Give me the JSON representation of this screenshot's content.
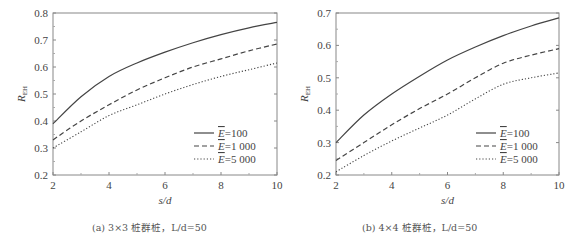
{
  "chart_data": [
    {
      "type": "line",
      "panel": "a",
      "caption": "(a) 3×3 桩群桩，L/d=50",
      "xlabel": "s/d",
      "ylabel": "R_EH",
      "xlim": [
        2,
        10
      ],
      "ylim": [
        0.2,
        0.8
      ],
      "xticks": [
        2,
        4,
        6,
        8,
        10
      ],
      "yticks": [
        0.2,
        0.3,
        0.4,
        0.5,
        0.6,
        0.7,
        0.8
      ],
      "grid": false,
      "legend_position": "lower right",
      "x": [
        2,
        3,
        4,
        5,
        6,
        7,
        8,
        9,
        10
      ],
      "series": [
        {
          "name": "Ē=100",
          "style": "solid",
          "values": [
            0.39,
            0.49,
            0.565,
            0.615,
            0.655,
            0.69,
            0.72,
            0.745,
            0.765
          ]
        },
        {
          "name": "Ē=1 000",
          "style": "dashed",
          "values": [
            0.33,
            0.4,
            0.46,
            0.515,
            0.56,
            0.6,
            0.63,
            0.66,
            0.685
          ]
        },
        {
          "name": "Ē=5 000",
          "style": "dotted",
          "values": [
            0.3,
            0.36,
            0.42,
            0.46,
            0.5,
            0.535,
            0.565,
            0.59,
            0.615
          ]
        }
      ]
    },
    {
      "type": "line",
      "panel": "b",
      "caption": "(b) 4×4 桩群桩，L/d=50",
      "xlabel": "s/d",
      "ylabel": "R_EH",
      "xlim": [
        2,
        10
      ],
      "ylim": [
        0.2,
        0.7
      ],
      "xticks": [
        2,
        4,
        6,
        8,
        10
      ],
      "yticks": [
        0.2,
        0.3,
        0.4,
        0.5,
        0.6,
        0.7
      ],
      "grid": false,
      "legend_position": "lower right",
      "x": [
        2,
        3,
        4,
        5,
        6,
        7,
        8,
        9,
        10
      ],
      "series": [
        {
          "name": "Ē=100",
          "style": "solid",
          "values": [
            0.3,
            0.385,
            0.45,
            0.505,
            0.555,
            0.595,
            0.63,
            0.66,
            0.685
          ]
        },
        {
          "name": "Ē=1 000",
          "style": "dashed",
          "values": [
            0.245,
            0.3,
            0.355,
            0.405,
            0.45,
            0.5,
            0.545,
            0.57,
            0.59
          ]
        },
        {
          "name": "Ē=5 000",
          "style": "dotted",
          "values": [
            0.21,
            0.26,
            0.305,
            0.345,
            0.385,
            0.435,
            0.48,
            0.5,
            0.515
          ]
        }
      ]
    }
  ],
  "legend": {
    "e_symbol": "E",
    "entries": [
      "=100",
      "=1 000",
      "=5 000"
    ]
  },
  "captions": {
    "a": "(a) 3×3 桩群桩，L/d=50",
    "b": "(b) 4×4 桩群桩，L/d=50"
  },
  "axis": {
    "xlabel": "s/d",
    "ylabel_main": "R",
    "ylabel_sub": "EH"
  }
}
